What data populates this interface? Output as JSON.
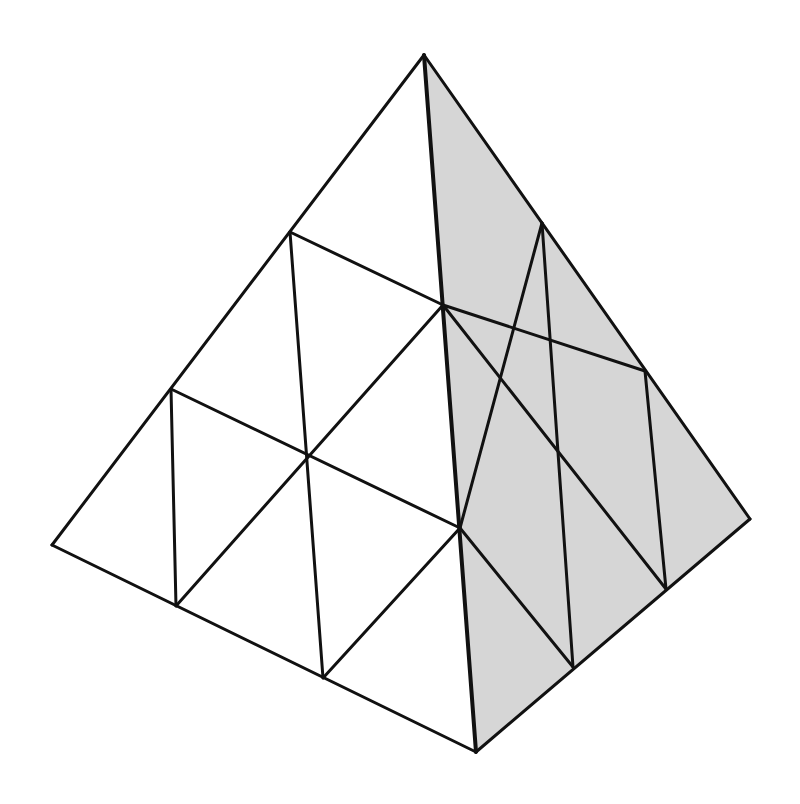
{
  "diagram": {
    "type": "subdivided-tetrahedron",
    "canvas": {
      "width": 800,
      "height": 804
    },
    "colors": {
      "background": "#ffffff",
      "left_face_fill": "#ffffff",
      "right_face_fill": "#d6d6d6",
      "stroke": "#111111"
    },
    "stroke_width": 3,
    "outer_edge_width": 3,
    "front_edge_width": 4,
    "vertices": {
      "apex": [
        424,
        55
      ],
      "left": [
        52,
        545
      ],
      "bottom": [
        476,
        752
      ],
      "right": [
        750,
        519
      ],
      "le1": [
        290,
        232
      ],
      "le2": [
        171,
        389
      ],
      "fe1": [
        443,
        305
      ],
      "fe2": [
        460,
        528
      ],
      "be1": [
        176,
        606
      ],
      "be2": [
        323,
        678
      ],
      "lc": [
        307,
        455
      ],
      "re1": [
        542,
        223
      ],
      "re2": [
        645,
        371
      ],
      "rb1": [
        573,
        667
      ],
      "rb2": [
        666,
        589
      ],
      "rc": [
        556,
        448
      ]
    },
    "left_face_polygon": [
      "apex",
      "left",
      "bottom"
    ],
    "right_face_polygon": [
      "apex",
      "bottom",
      "right"
    ],
    "edges": [
      [
        "apex",
        "left"
      ],
      [
        "left",
        "bottom"
      ],
      [
        "bottom",
        "right"
      ],
      [
        "right",
        "apex"
      ],
      [
        "apex",
        "bottom"
      ],
      [
        "le1",
        "fe1"
      ],
      [
        "le2",
        "fe2"
      ],
      [
        "le1",
        "be2"
      ],
      [
        "le2",
        "be1"
      ],
      [
        "be1",
        "fe1"
      ],
      [
        "be2",
        "fe2"
      ],
      [
        "fe1",
        "re2"
      ],
      [
        "fe2",
        "re1"
      ],
      [
        "re1",
        "rb1"
      ],
      [
        "re2",
        "rb2"
      ],
      [
        "fe1",
        "rb2"
      ],
      [
        "fe2",
        "rb1"
      ]
    ]
  }
}
